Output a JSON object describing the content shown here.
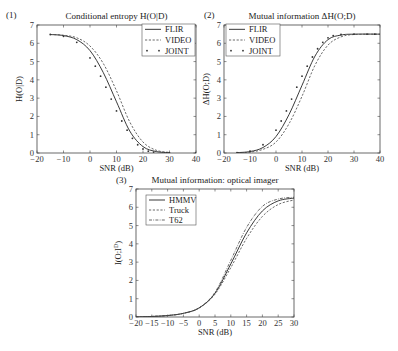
{
  "chart_data": [
    {
      "type": "line",
      "panel": "(1)",
      "title": "Conditional entropy H(O|D)",
      "xlabel": "SNR (dB)",
      "ylabel": "H(O|D)",
      "xlim": [
        -20,
        40
      ],
      "ylim": [
        0,
        7
      ],
      "xticks": [
        -20,
        -10,
        0,
        10,
        20,
        30,
        40
      ],
      "yticks": [
        0,
        1,
        2,
        3,
        4,
        5,
        6,
        7
      ],
      "legend_position": "upper right",
      "series": [
        {
          "name": "FLIR",
          "style": "solid",
          "x": [
            -15,
            -10,
            -5,
            0,
            5,
            10,
            15,
            20,
            25,
            30
          ],
          "values": [
            6.48,
            6.42,
            6.2,
            5.6,
            4.4,
            2.8,
            1.2,
            0.35,
            0.08,
            0.02
          ]
        },
        {
          "name": "VIDEO",
          "style": "dashed",
          "x": [
            -15,
            -10,
            -5,
            0,
            5,
            10,
            15,
            20,
            25,
            30
          ],
          "values": [
            6.48,
            6.44,
            6.3,
            5.85,
            4.9,
            3.4,
            1.7,
            0.6,
            0.15,
            0.03
          ]
        },
        {
          "name": "JOINT",
          "style": "dotted",
          "x": [
            -15,
            -10,
            -5,
            0,
            2,
            4,
            6,
            8,
            10,
            12,
            14,
            16,
            18,
            20,
            22,
            24,
            30,
            40
          ],
          "values": [
            6.48,
            6.38,
            6.05,
            5.2,
            4.75,
            4.2,
            3.6,
            2.95,
            2.3,
            1.75,
            1.25,
            0.8,
            0.45,
            0.22,
            0.1,
            0.05,
            0.01,
            0.0
          ]
        }
      ]
    },
    {
      "type": "line",
      "panel": "(2)",
      "title": "Mutual information ΔH(O;D)",
      "xlabel": "SNR (dB)",
      "ylabel": "ΔH(O;D)",
      "xlim": [
        -20,
        40
      ],
      "ylim": [
        0,
        7
      ],
      "xticks": [
        -20,
        -10,
        0,
        10,
        20,
        30,
        40
      ],
      "yticks": [
        0,
        1,
        2,
        3,
        4,
        5,
        6,
        7
      ],
      "legend_position": "upper left",
      "series": [
        {
          "name": "FLIR",
          "style": "solid",
          "x": [
            -15,
            -10,
            -5,
            0,
            5,
            10,
            15,
            20,
            25,
            30,
            40
          ],
          "values": [
            0.02,
            0.08,
            0.3,
            0.9,
            2.1,
            3.7,
            5.3,
            6.2,
            6.45,
            6.5,
            6.5
          ]
        },
        {
          "name": "VIDEO",
          "style": "dashed",
          "x": [
            -15,
            -10,
            -5,
            0,
            5,
            10,
            15,
            20,
            25,
            30,
            40
          ],
          "values": [
            0.01,
            0.05,
            0.2,
            0.6,
            1.6,
            3.1,
            4.8,
            5.9,
            6.35,
            6.48,
            6.5
          ]
        },
        {
          "name": "JOINT",
          "style": "dotted",
          "x": [
            -15,
            -10,
            -5,
            0,
            2,
            4,
            6,
            8,
            10,
            12,
            14,
            16,
            18,
            20,
            22,
            25,
            30,
            35,
            38
          ],
          "values": [
            0.02,
            0.1,
            0.45,
            1.25,
            1.75,
            2.3,
            2.95,
            3.6,
            4.2,
            4.75,
            5.25,
            5.7,
            6.05,
            6.3,
            6.42,
            6.48,
            6.5,
            6.5,
            6.5
          ]
        }
      ]
    },
    {
      "type": "line",
      "panel": "(3)",
      "title": "Mutual information: optical imager",
      "xlabel": "SNR (dB)",
      "ylabel": "I(O;I^D)",
      "xlim": [
        -20,
        30
      ],
      "ylim": [
        0,
        7
      ],
      "xticks": [
        -20,
        -15,
        -10,
        -5,
        0,
        5,
        10,
        15,
        20,
        25,
        30
      ],
      "yticks": [
        0,
        1,
        2,
        3,
        4,
        5,
        6,
        7
      ],
      "legend_position": "upper left",
      "series": [
        {
          "name": "HMMV",
          "style": "solid",
          "x": [
            -20,
            -15,
            -10,
            -5,
            0,
            5,
            10,
            15,
            20,
            25,
            30
          ],
          "values": [
            0.0,
            0.03,
            0.08,
            0.2,
            0.5,
            1.3,
            2.9,
            4.6,
            5.8,
            6.35,
            6.5
          ]
        },
        {
          "name": "Truck",
          "style": "dashed",
          "x": [
            -20,
            -15,
            -10,
            -5,
            0,
            5,
            10,
            15,
            20,
            25,
            30
          ],
          "values": [
            0.0,
            0.03,
            0.08,
            0.2,
            0.5,
            1.25,
            2.7,
            4.3,
            5.5,
            6.15,
            6.4
          ]
        },
        {
          "name": "T62",
          "style": "dashdot",
          "x": [
            -20,
            -15,
            -10,
            -5,
            0,
            5,
            10,
            15,
            20,
            25,
            30
          ],
          "values": [
            0.0,
            0.03,
            0.08,
            0.2,
            0.5,
            1.35,
            3.1,
            4.9,
            6.05,
            6.45,
            6.55
          ]
        }
      ]
    }
  ]
}
